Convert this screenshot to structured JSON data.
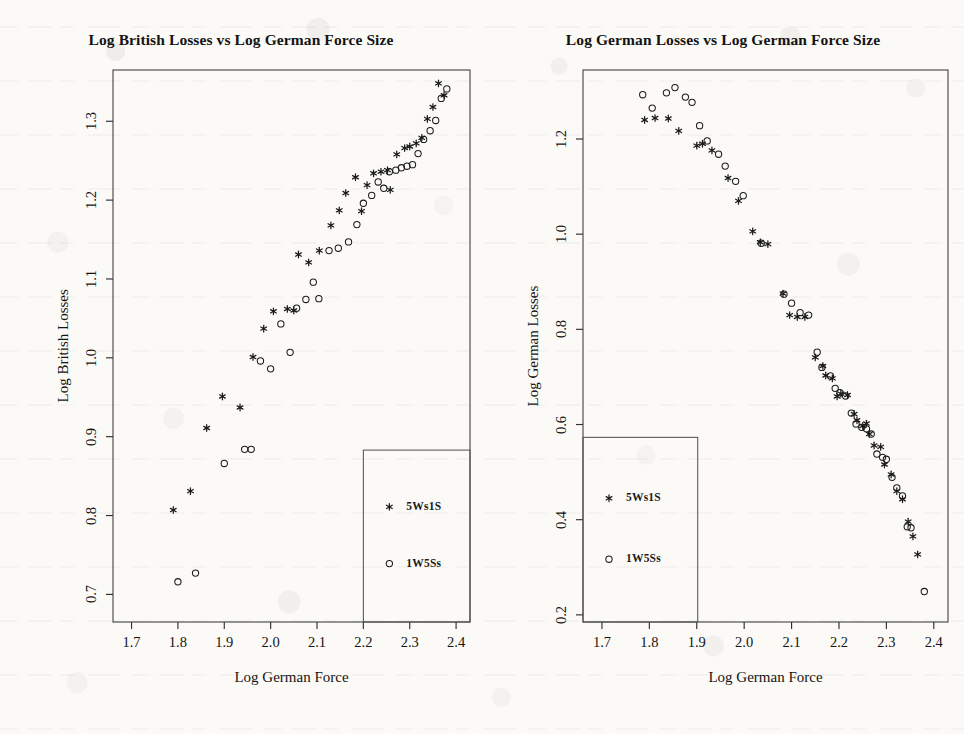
{
  "figure": {
    "background_color": "#fbfaf7",
    "ink_color": "#1b1b1b",
    "panel_count": 2
  },
  "series_names": {
    "a": "5Ws1S",
    "b": "1W5Ss"
  },
  "chart_data": [
    {
      "type": "scatter",
      "panel": "left",
      "title": "Log British Losses vs Log German Force Size",
      "xlabel": "Log German Force",
      "ylabel": "Log British Losses",
      "xlim": [
        1.66,
        2.43
      ],
      "ylim": [
        0.665,
        1.365
      ],
      "xticks": [
        1.7,
        1.8,
        1.9,
        2.0,
        2.1,
        2.2,
        2.3,
        2.4
      ],
      "xticklabels": [
        "1.7",
        "1.8",
        "1.9",
        "2.0",
        "2.1",
        "2.2",
        "2.3",
        "2.4"
      ],
      "yticks": [
        0.7,
        0.8,
        0.9,
        1.0,
        1.1,
        1.2,
        1.3
      ],
      "yticklabels": [
        "0.7",
        "0.8",
        "0.9",
        "1.0",
        "1.1",
        "1.2",
        "1.3"
      ],
      "grid": false,
      "legend_position": "bottom-right",
      "series": [
        {
          "name": "5Ws1S",
          "marker": "asterisk",
          "points": [
            [
              1.79,
              0.807
            ],
            [
              1.827,
              0.831
            ],
            [
              1.862,
              0.911
            ],
            [
              1.896,
              0.951
            ],
            [
              1.934,
              0.937
            ],
            [
              1.962,
              1.001
            ],
            [
              1.985,
              1.037
            ],
            [
              2.006,
              1.059
            ],
            [
              2.036,
              1.062
            ],
            [
              2.05,
              1.06
            ],
            [
              2.06,
              1.131
            ],
            [
              2.082,
              1.121
            ],
            [
              2.105,
              1.136
            ],
            [
              2.13,
              1.168
            ],
            [
              2.148,
              1.187
            ],
            [
              2.162,
              1.209
            ],
            [
              2.183,
              1.229
            ],
            [
              2.196,
              1.186
            ],
            [
              2.208,
              1.219
            ],
            [
              2.222,
              1.234
            ],
            [
              2.238,
              1.236
            ],
            [
              2.252,
              1.238
            ],
            [
              2.258,
              1.213
            ],
            [
              2.272,
              1.258
            ],
            [
              2.289,
              1.266
            ],
            [
              2.3,
              1.268
            ],
            [
              2.314,
              1.272
            ],
            [
              2.326,
              1.279
            ],
            [
              2.338,
              1.303
            ],
            [
              2.35,
              1.318
            ],
            [
              2.362,
              1.348
            ],
            [
              2.374,
              1.333
            ]
          ]
        },
        {
          "name": "1W5Ss",
          "marker": "open-circle",
          "points": [
            [
              1.8,
              0.716
            ],
            [
              1.838,
              0.727
            ],
            [
              1.9,
              0.866
            ],
            [
              1.944,
              0.884
            ],
            [
              1.958,
              0.884
            ],
            [
              1.978,
              0.996
            ],
            [
              2.0,
              0.986
            ],
            [
              2.022,
              1.043
            ],
            [
              2.042,
              1.007
            ],
            [
              2.056,
              1.063
            ],
            [
              2.076,
              1.074
            ],
            [
              2.092,
              1.096
            ],
            [
              2.104,
              1.075
            ],
            [
              2.126,
              1.136
            ],
            [
              2.146,
              1.139
            ],
            [
              2.168,
              1.147
            ],
            [
              2.186,
              1.169
            ],
            [
              2.2,
              1.196
            ],
            [
              2.218,
              1.206
            ],
            [
              2.232,
              1.223
            ],
            [
              2.244,
              1.215
            ],
            [
              2.256,
              1.236
            ],
            [
              2.27,
              1.238
            ],
            [
              2.282,
              1.241
            ],
            [
              2.294,
              1.243
            ],
            [
              2.306,
              1.245
            ],
            [
              2.318,
              1.259
            ],
            [
              2.33,
              1.277
            ],
            [
              2.344,
              1.288
            ],
            [
              2.356,
              1.301
            ],
            [
              2.368,
              1.329
            ],
            [
              2.38,
              1.341
            ]
          ]
        }
      ],
      "legend_box": {
        "x0": 2.2,
        "x1": 2.43,
        "y0": 0.665,
        "y1": 0.883
      }
    },
    {
      "type": "scatter",
      "panel": "right",
      "title": "Log German Losses vs Log German Force Size",
      "xlabel": "Log German Force",
      "ylabel": "Log German Losses",
      "xlim": [
        1.66,
        2.43
      ],
      "ylim": [
        0.185,
        1.345
      ],
      "xticks": [
        1.7,
        1.8,
        1.9,
        2.0,
        2.1,
        2.2,
        2.3,
        2.4
      ],
      "xticklabels": [
        "1.7",
        "1.8",
        "1.9",
        "2.0",
        "2.1",
        "2.2",
        "2.3",
        "2.4"
      ],
      "yticks": [
        0.2,
        0.4,
        0.6,
        0.8,
        1.0,
        1.2
      ],
      "yticklabels": [
        "0.2",
        "0.4",
        "0.6",
        "0.8",
        "1.0",
        "1.2"
      ],
      "grid": false,
      "legend_position": "bottom-left",
      "series": [
        {
          "name": "5Ws1S",
          "marker": "asterisk",
          "points": [
            [
              1.79,
              1.24
            ],
            [
              1.812,
              1.244
            ],
            [
              1.84,
              1.243
            ],
            [
              1.862,
              1.217
            ],
            [
              1.9,
              1.186
            ],
            [
              1.912,
              1.19
            ],
            [
              1.932,
              1.176
            ],
            [
              1.966,
              1.118
            ],
            [
              1.988,
              1.07
            ],
            [
              2.018,
              1.006
            ],
            [
              2.034,
              0.983
            ],
            [
              2.05,
              0.979
            ],
            [
              2.082,
              0.875
            ],
            [
              2.096,
              0.83
            ],
            [
              2.112,
              0.826
            ],
            [
              2.128,
              0.826
            ],
            [
              2.15,
              0.741
            ],
            [
              2.166,
              0.723
            ],
            [
              2.172,
              0.703
            ],
            [
              2.186,
              0.697
            ],
            [
              2.196,
              0.659
            ],
            [
              2.204,
              0.665
            ],
            [
              2.218,
              0.662
            ],
            [
              2.232,
              0.622
            ],
            [
              2.238,
              0.609
            ],
            [
              2.25,
              0.597
            ],
            [
              2.258,
              0.602
            ],
            [
              2.264,
              0.58
            ],
            [
              2.274,
              0.556
            ],
            [
              2.288,
              0.553
            ],
            [
              2.296,
              0.516
            ],
            [
              2.31,
              0.495
            ],
            [
              2.322,
              0.46
            ],
            [
              2.334,
              0.443
            ],
            [
              2.346,
              0.396
            ],
            [
              2.356,
              0.365
            ],
            [
              2.366,
              0.327
            ]
          ]
        },
        {
          "name": "1W5Ss",
          "marker": "open-circle",
          "points": [
            [
              1.786,
              1.293
            ],
            [
              1.806,
              1.265
            ],
            [
              1.836,
              1.297
            ],
            [
              1.854,
              1.308
            ],
            [
              1.876,
              1.288
            ],
            [
              1.89,
              1.277
            ],
            [
              1.906,
              1.228
            ],
            [
              1.922,
              1.196
            ],
            [
              1.946,
              1.168
            ],
            [
              1.96,
              1.143
            ],
            [
              1.982,
              1.111
            ],
            [
              1.998,
              1.081
            ],
            [
              2.036,
              0.981
            ],
            [
              2.084,
              0.874
            ],
            [
              2.1,
              0.855
            ],
            [
              2.118,
              0.835
            ],
            [
              2.136,
              0.83
            ],
            [
              2.154,
              0.752
            ],
            [
              2.164,
              0.72
            ],
            [
              2.182,
              0.702
            ],
            [
              2.192,
              0.676
            ],
            [
              2.202,
              0.667
            ],
            [
              2.214,
              0.66
            ],
            [
              2.226,
              0.624
            ],
            [
              2.236,
              0.601
            ],
            [
              2.248,
              0.594
            ],
            [
              2.258,
              0.591
            ],
            [
              2.268,
              0.58
            ],
            [
              2.28,
              0.538
            ],
            [
              2.292,
              0.531
            ],
            [
              2.3,
              0.527
            ],
            [
              2.312,
              0.489
            ],
            [
              2.322,
              0.467
            ],
            [
              2.334,
              0.45
            ],
            [
              2.344,
              0.385
            ],
            [
              2.352,
              0.383
            ],
            [
              2.38,
              0.249
            ]
          ]
        }
      ],
      "legend_box": {
        "x0": 1.66,
        "x1": 1.902,
        "y0": 0.185,
        "y1": 0.573
      }
    }
  ]
}
